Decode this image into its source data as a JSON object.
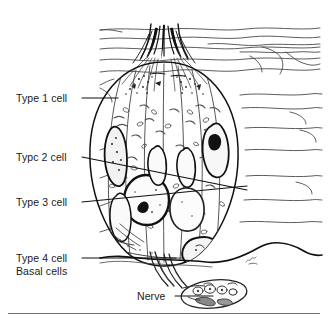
{
  "figure": {
    "background_color": "#ffffff",
    "ink_color": "#1b1b1b",
    "rule_color": "#6e6e6e"
  },
  "labels": {
    "type1": "Type 1 cell",
    "type2": "Typc 2 cell",
    "type3": "Type 3 cell",
    "type4": "Type 4 cell",
    "basal": "Basal cells",
    "nerve": "Nerve"
  },
  "leader_lines": [
    {
      "name": "leader-type1",
      "from": [
        82,
        98
      ],
      "to": [
        118,
        98
      ]
    },
    {
      "name": "leader-type2",
      "from": [
        82,
        157
      ],
      "to": [
        247,
        190
      ]
    },
    {
      "name": "leader-type3",
      "from": [
        82,
        202
      ],
      "to": [
        247,
        186
      ]
    },
    {
      "name": "leader-type4",
      "from": [
        82,
        258
      ],
      "to": [
        176,
        258
      ]
    },
    {
      "name": "leader-nerve",
      "from": [
        175,
        296
      ],
      "to": [
        213,
        296
      ]
    }
  ],
  "artist_signature": {
    "present": true,
    "position": [
      248,
      261
    ]
  }
}
